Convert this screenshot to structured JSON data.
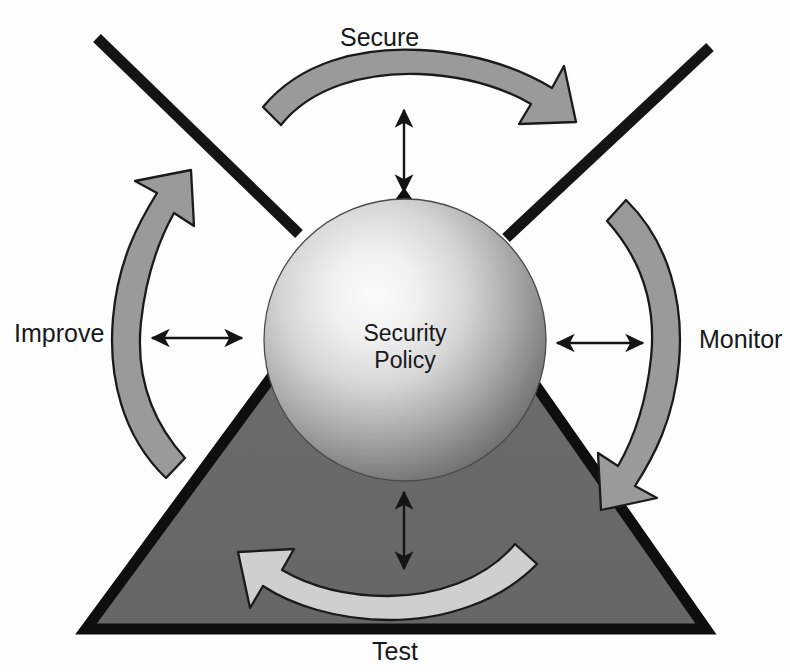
{
  "diagram": {
    "center": {
      "line1": "Security",
      "line2": "Policy"
    },
    "stages": [
      {
        "id": "secure",
        "label": "Secure",
        "position": "top",
        "arrow_direction": "clockwise-right"
      },
      {
        "id": "monitor",
        "label": "Monitor",
        "position": "right",
        "arrow_direction": "clockwise-down"
      },
      {
        "id": "test",
        "label": "Test",
        "position": "bottom",
        "arrow_direction": "clockwise-left"
      },
      {
        "id": "improve",
        "label": "Improve",
        "position": "left",
        "arrow_direction": "clockwise-up"
      }
    ],
    "connectors": [
      {
        "id": "connector-top",
        "orientation": "vertical",
        "heads": "both"
      },
      {
        "id": "connector-left",
        "orientation": "horizontal",
        "heads": "both"
      },
      {
        "id": "connector-right",
        "orientation": "horizontal",
        "heads": "both"
      },
      {
        "id": "connector-bottom",
        "orientation": "vertical",
        "heads": "both"
      }
    ],
    "shapes": {
      "triangle": "dark-gray-triangle-with-black-border",
      "diagonals": "two-black-diagonal-lines-forming-x",
      "sphere": "radial-gradient-gray-sphere"
    },
    "colors": {
      "background": "#fdfdfd",
      "arrow_fill": "#9a9a9a",
      "arrow_fill_light": "#cfcfcf",
      "arrow_stroke": "#1a1a1a",
      "triangle_fill": "#6b6b6b",
      "triangle_stroke": "#111111",
      "line_black": "#141414",
      "text": "#17181a",
      "sphere_light": "#f2f2f2",
      "sphere_dark": "#6e6e6e"
    }
  }
}
